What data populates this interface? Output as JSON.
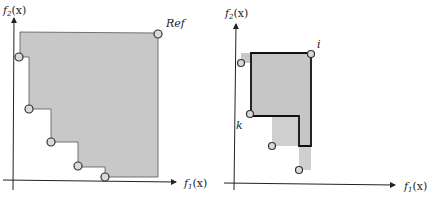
{
  "colors": {
    "fill": "#c8c8c8",
    "fill_light": "#cfcfcf",
    "stroke": "#333333",
    "bold": "#111111",
    "point_fill": "#d9d9d9"
  },
  "left": {
    "y_label": "f2(x)",
    "y_label_main": "f",
    "y_label_sub": "2",
    "y_label_arg": "(x)",
    "x_label_main": "f",
    "x_label_sub": "1",
    "x_label_arg": "(x)",
    "ref_label": "Ref",
    "points": [
      [
        19,
        57
      ],
      [
        29,
        109
      ],
      [
        51,
        142
      ],
      [
        78,
        166
      ],
      [
        105,
        177
      ]
    ],
    "ref_point": [
      158,
      34
    ]
  },
  "right": {
    "y_label_main": "f",
    "y_label_sub": "2",
    "y_label_arg": "(x)",
    "x_label_main": "f",
    "x_label_sub": "1",
    "x_label_arg": "(x)",
    "i_label": "i",
    "k_label": "k",
    "points": [
      [
        241,
        63
      ],
      [
        250,
        114
      ],
      [
        272,
        146
      ],
      [
        299,
        170
      ]
    ],
    "i_point": [
      311,
      54
    ]
  }
}
